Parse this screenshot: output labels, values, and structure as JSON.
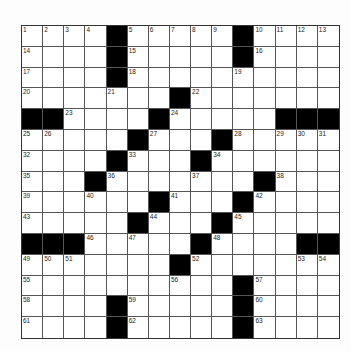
{
  "puzzle": {
    "rows": 15,
    "cols": 15,
    "colors": {
      "black": "#000000",
      "white": "#ffffff",
      "line": "#555555",
      "background": "#fdfdfd"
    },
    "black_cells": [
      [
        0,
        4
      ],
      [
        0,
        10
      ],
      [
        1,
        4
      ],
      [
        1,
        10
      ],
      [
        2,
        4
      ],
      [
        3,
        7
      ],
      [
        4,
        0
      ],
      [
        4,
        1
      ],
      [
        4,
        6
      ],
      [
        4,
        12
      ],
      [
        4,
        13
      ],
      [
        4,
        14
      ],
      [
        5,
        5
      ],
      [
        5,
        9
      ],
      [
        6,
        4
      ],
      [
        6,
        8
      ],
      [
        7,
        3
      ],
      [
        7,
        11
      ],
      [
        8,
        6
      ],
      [
        8,
        10
      ],
      [
        9,
        5
      ],
      [
        9,
        9
      ],
      [
        10,
        0
      ],
      [
        10,
        1
      ],
      [
        10,
        2
      ],
      [
        10,
        8
      ],
      [
        10,
        13
      ],
      [
        10,
        14
      ],
      [
        11,
        7
      ],
      [
        12,
        10
      ],
      [
        13,
        4
      ],
      [
        13,
        10
      ],
      [
        14,
        4
      ],
      [
        14,
        10
      ]
    ],
    "numbers": [
      {
        "r": 0,
        "c": 0,
        "n": "1"
      },
      {
        "r": 0,
        "c": 1,
        "n": "2"
      },
      {
        "r": 0,
        "c": 2,
        "n": "3"
      },
      {
        "r": 0,
        "c": 3,
        "n": "4"
      },
      {
        "r": 0,
        "c": 5,
        "n": "5"
      },
      {
        "r": 0,
        "c": 6,
        "n": "6"
      },
      {
        "r": 0,
        "c": 7,
        "n": "7"
      },
      {
        "r": 0,
        "c": 8,
        "n": "8"
      },
      {
        "r": 0,
        "c": 9,
        "n": "9"
      },
      {
        "r": 0,
        "c": 11,
        "n": "10"
      },
      {
        "r": 0,
        "c": 12,
        "n": "11"
      },
      {
        "r": 0,
        "c": 13,
        "n": "12"
      },
      {
        "r": 0,
        "c": 14,
        "n": "13"
      },
      {
        "r": 1,
        "c": 0,
        "n": "14"
      },
      {
        "r": 1,
        "c": 5,
        "n": "15"
      },
      {
        "r": 1,
        "c": 11,
        "n": "16"
      },
      {
        "r": 2,
        "c": 0,
        "n": "17"
      },
      {
        "r": 2,
        "c": 5,
        "n": "18"
      },
      {
        "r": 2,
        "c": 10,
        "n": "19"
      },
      {
        "r": 3,
        "c": 0,
        "n": "20"
      },
      {
        "r": 3,
        "c": 4,
        "n": "21"
      },
      {
        "r": 3,
        "c": 8,
        "n": "22"
      },
      {
        "r": 4,
        "c": 2,
        "n": "23"
      },
      {
        "r": 4,
        "c": 7,
        "n": "24"
      },
      {
        "r": 5,
        "c": 0,
        "n": "25"
      },
      {
        "r": 5,
        "c": 1,
        "n": "26"
      },
      {
        "r": 5,
        "c": 6,
        "n": "27"
      },
      {
        "r": 5,
        "c": 10,
        "n": "28"
      },
      {
        "r": 5,
        "c": 12,
        "n": "29"
      },
      {
        "r": 5,
        "c": 13,
        "n": "30"
      },
      {
        "r": 5,
        "c": 14,
        "n": "31"
      },
      {
        "r": 6,
        "c": 0,
        "n": "32"
      },
      {
        "r": 6,
        "c": 5,
        "n": "33"
      },
      {
        "r": 6,
        "c": 9,
        "n": "34"
      },
      {
        "r": 7,
        "c": 0,
        "n": "35"
      },
      {
        "r": 7,
        "c": 4,
        "n": "36"
      },
      {
        "r": 7,
        "c": 8,
        "n": "37"
      },
      {
        "r": 7,
        "c": 12,
        "n": "38"
      },
      {
        "r": 8,
        "c": 0,
        "n": "39"
      },
      {
        "r": 8,
        "c": 3,
        "n": "40"
      },
      {
        "r": 8,
        "c": 7,
        "n": "41"
      },
      {
        "r": 8,
        "c": 11,
        "n": "42"
      },
      {
        "r": 9,
        "c": 0,
        "n": "43"
      },
      {
        "r": 9,
        "c": 6,
        "n": "44"
      },
      {
        "r": 9,
        "c": 10,
        "n": "45"
      },
      {
        "r": 10,
        "c": 3,
        "n": "46"
      },
      {
        "r": 10,
        "c": 5,
        "n": "47"
      },
      {
        "r": 10,
        "c": 9,
        "n": "48"
      },
      {
        "r": 11,
        "c": 0,
        "n": "49"
      },
      {
        "r": 11,
        "c": 1,
        "n": "50"
      },
      {
        "r": 11,
        "c": 2,
        "n": "51"
      },
      {
        "r": 11,
        "c": 8,
        "n": "52"
      },
      {
        "r": 11,
        "c": 13,
        "n": "53"
      },
      {
        "r": 11,
        "c": 14,
        "n": "54"
      },
      {
        "r": 12,
        "c": 0,
        "n": "55"
      },
      {
        "r": 12,
        "c": 7,
        "n": "56"
      },
      {
        "r": 12,
        "c": 11,
        "n": "57"
      },
      {
        "r": 13,
        "c": 0,
        "n": "58"
      },
      {
        "r": 13,
        "c": 5,
        "n": "59"
      },
      {
        "r": 13,
        "c": 11,
        "n": "60"
      },
      {
        "r": 14,
        "c": 0,
        "n": "61"
      },
      {
        "r": 14,
        "c": 5,
        "n": "62"
      },
      {
        "r": 14,
        "c": 11,
        "n": "63"
      }
    ]
  }
}
